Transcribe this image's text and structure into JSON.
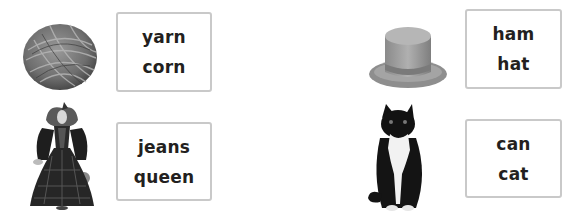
{
  "items": [
    {
      "picture": "ball-of-yarn",
      "choices": [
        "yarn",
        "corn"
      ]
    },
    {
      "picture": "queen",
      "choices": [
        "jeans",
        "queen"
      ]
    },
    {
      "picture": "top-hat",
      "choices": [
        "ham",
        "hat"
      ]
    },
    {
      "picture": "cat",
      "choices": [
        "can",
        "cat"
      ]
    }
  ],
  "colors": {
    "box_border": "#c9c9c9",
    "text": "#231f20",
    "background": "#ffffff"
  }
}
